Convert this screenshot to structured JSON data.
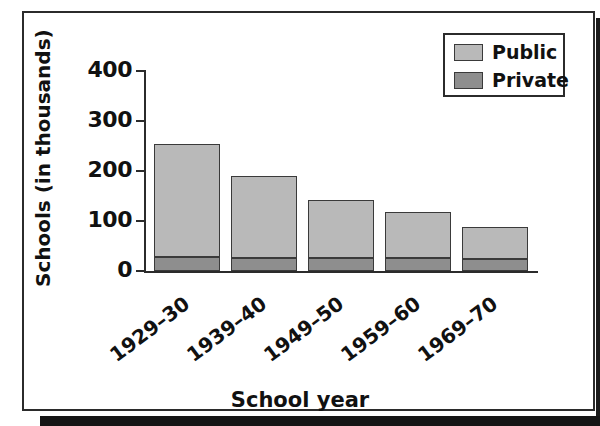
{
  "chart_data": {
    "type": "bar",
    "subtype": "stacked-bar",
    "title": "",
    "xlabel": "School year",
    "ylabel": "Schools (in thousands)",
    "categories": [
      "1929–30",
      "1939–40",
      "1949–50",
      "1959–60",
      "1969–70"
    ],
    "series": [
      {
        "name": "Private",
        "color": "#8e8e8e",
        "values": [
          28,
          27,
          27,
          27,
          25
        ]
      },
      {
        "name": "Public",
        "color": "#b9b9b9",
        "values": [
          227,
          163,
          115,
          92,
          64
        ]
      }
    ],
    "totals": [
      255,
      190,
      142,
      119,
      89
    ],
    "stack_order": [
      "Private",
      "Public"
    ],
    "yticks": [
      0,
      100,
      200,
      300,
      400
    ],
    "ytick_labels": [
      "0",
      "100",
      "200",
      "300",
      "400"
    ],
    "ylim": [
      0,
      400
    ],
    "grid": false,
    "legend_position": "top-right",
    "legend_entries": [
      "Public",
      "Private"
    ]
  },
  "axes": {
    "y_title": "Schools (in thousands)",
    "x_title": "School year"
  },
  "legend": {
    "items": [
      {
        "label": "Public",
        "swatch": "light-gray-swatch"
      },
      {
        "label": "Private",
        "swatch": "dark-gray-swatch"
      }
    ]
  },
  "colors": {
    "public": "#b9b9b9",
    "private": "#8e8e8e",
    "outline": "#3a3a3a",
    "axis": "#2b2b2b",
    "text": "#111111",
    "background": "#ffffff"
  }
}
